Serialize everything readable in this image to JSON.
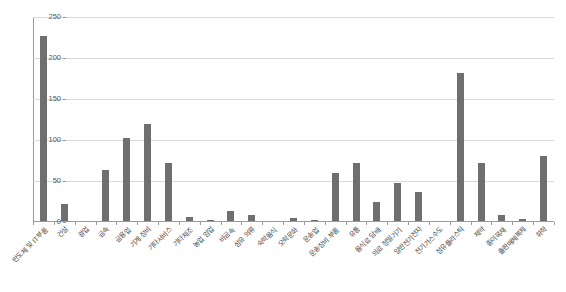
{
  "chart_data": {
    "type": "bar",
    "title": "",
    "subtitle": "",
    "xlabel": "",
    "ylabel": "",
    "ylim": [
      0,
      250
    ],
    "yticks": [
      0,
      50,
      100,
      150,
      200,
      250
    ],
    "grid": true,
    "legend": false,
    "legend_position": "none",
    "bar_color": "#6f6f6f",
    "gridline_color": "#d9d9d9",
    "axis_color": "#9a9a9a",
    "categories": [
      "반도체 및 IT부품",
      "건설",
      "광업",
      "금속",
      "금융업",
      "기계 장비",
      "기타서비스",
      "기타제조",
      "농업 임업",
      "비금속",
      "섬유 의류",
      "숙박음식",
      "오락문화",
      "운송업",
      "운송장비 부품",
      "유통",
      "음식료 담배",
      "의료 정밀기기",
      "일반전기전자",
      "전기가스수도",
      "정유플라스틱",
      "제약",
      "종이목재",
      "출판매체복제",
      "화학"
    ],
    "values": [
      227,
      22,
      1,
      64,
      103,
      120,
      72,
      6,
      2,
      13,
      9,
      1,
      5,
      3,
      60,
      72,
      24,
      47,
      36,
      1,
      182,
      72,
      8,
      4,
      81
    ]
  }
}
